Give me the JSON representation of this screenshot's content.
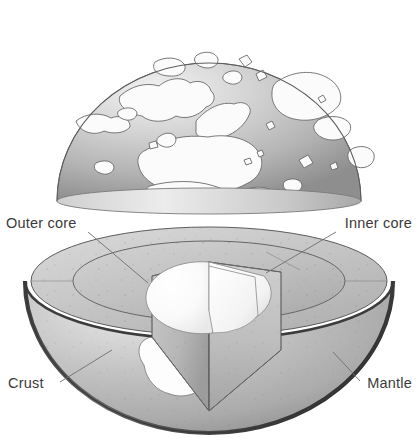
{
  "figure": {
    "background_color": "#ffffff",
    "width": 418,
    "height": 447
  },
  "labels": [
    {
      "id": "outer-core",
      "text": "Outer core",
      "position": "upper-left",
      "x": 6,
      "y": 228,
      "leader_from": [
        88,
        232
      ],
      "leader_to": [
        148,
        283
      ]
    },
    {
      "id": "inner-core",
      "text": "Inner core",
      "position": "upper-right",
      "x": 340,
      "y": 228,
      "leader_from": [
        336,
        232
      ],
      "leader_to": [
        266,
        273
      ]
    },
    {
      "id": "crust",
      "text": "Crust",
      "position": "lower-left",
      "x": 10,
      "y": 388,
      "leader_from": [
        60,
        382
      ],
      "leader_to": [
        108,
        352
      ]
    },
    {
      "id": "mantle",
      "text": "Mantle",
      "position": "lower-right",
      "x": 363,
      "y": 388,
      "leader_from": [
        360,
        381
      ],
      "leader_to": [
        333,
        352
      ]
    }
  ],
  "upper_hemisphere": {
    "name": "globe-dome",
    "description": "Upper dome of the Earth showing grayscale surface with continent outlines, northern polar aspect",
    "surface_ocean_color": "#b9b9b9",
    "surface_land_color": "#fbfbfb",
    "outline_color": "#6a6a6a",
    "highlight": "upper-left",
    "cut_edge": "flat-bottom-ellipse"
  },
  "lower_hemisphere": {
    "name": "earth-cutaway",
    "description": "Lower hemisphere cut away to reveal concentric interior layers with a wedge removed",
    "layers": [
      {
        "name": "Crust",
        "color": "#4a4a4a",
        "kind": "thin-outer-rim"
      },
      {
        "name": "Mantle",
        "color": "#b4b4b4",
        "kind": "outer-shell"
      },
      {
        "name": "Outer core",
        "color": "#c2c2c2",
        "kind": "middle-shell"
      },
      {
        "name": "Inner core",
        "color": "#fdfdfd",
        "kind": "center-sphere"
      }
    ],
    "surface_land_color": "#fefefe",
    "cut_face_color": "#c8c8c8",
    "speckle_color": "#5d5d5d"
  },
  "colors": {
    "text": "#3b3b3b",
    "leader_line": "#6e6e6e",
    "outline": "#555555",
    "crust_dark": "#3f3f3f",
    "mantle_light": "#bdbdbd",
    "mantle_shadow": "#9a9a9a",
    "outer_core": "#c4c4c4",
    "inner_core": "#ffffff",
    "background": "#ffffff"
  }
}
